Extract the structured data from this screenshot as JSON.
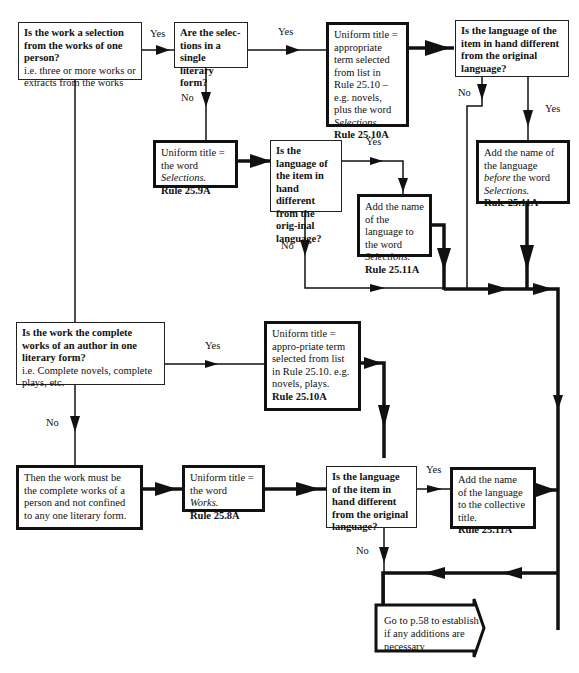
{
  "diagram": {
    "type": "flowchart"
  },
  "nodes": {
    "q_selection": {
      "question": "Is the work a selection from the works of one person?",
      "note": "i.e. three or more works or extracts from the works"
    },
    "q_single_form": {
      "question": "Are the selec-tions in a single literary form?"
    },
    "r_term_selections": {
      "line1": "Uniform title = appropriate term selected from list in Rule 25.10 – e.g. novels, plus the word",
      "italic": "Selections.",
      "rule": "Rule 25.10A"
    },
    "q_lang_top_right": {
      "question": "Is the language of the item in hand different from the original language?"
    },
    "r_lang_before": {
      "pre": "Add the name of the language",
      "italic1": "before",
      "mid": "the word",
      "italic2": "Selections.",
      "rule": "Rule 25.11A"
    },
    "r_word_selections": {
      "pre": "Uniform title = the word",
      "italic": "Selections.",
      "rule": "Rule 25.9A"
    },
    "q_lang_middle": {
      "question": "Is the language of the item in hand different from the orig-inal language?"
    },
    "r_lang_to_selections": {
      "pre": "Add the name of the language to the word",
      "italic": "Selections.",
      "rule": "Rule 25.11A"
    },
    "q_complete_form": {
      "question": "Is the work the complete works of an author in one literary form?",
      "note": "i.e. Complete novels, complete plays, etc."
    },
    "r_term_complete": {
      "text": "Uniform title = appro-priate term selected from list in Rule 25.10. e.g. novels, plays.",
      "rule": "Rule 25.10A"
    },
    "r_complete_person": {
      "text": "Then the work must be the complete works of a person and not confined to any one literary form."
    },
    "r_word_works": {
      "pre": "Uniform title = the word",
      "italic": "Works.",
      "rule": "Rule 25.8A"
    },
    "q_lang_bottom": {
      "question": "Is the language of the item in hand different from the original language?"
    },
    "r_lang_collective": {
      "text": "Add the name of the language to the collective title.",
      "rule": "Rule 25.11A"
    },
    "goto": {
      "line1": "Go to p.58 to establish",
      "line2": "if any additions are necessary"
    }
  },
  "edge_labels": {
    "yes": "Yes",
    "no": "No"
  },
  "colors": {
    "line": "#111111",
    "background": "#ffffff"
  }
}
